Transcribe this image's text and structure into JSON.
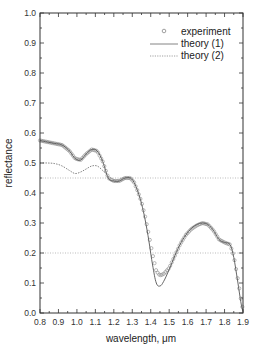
{
  "chart_data": {
    "type": "line",
    "title": "",
    "xlabel": "wavelength, μm",
    "ylabel": "reflectance",
    "xlim": [
      0.8,
      1.9
    ],
    "ylim": [
      0.0,
      1.0
    ],
    "xticks": [
      "0.8",
      "0.9",
      "1.0",
      "1.1",
      "1.2",
      "1.3",
      "1.4",
      "1.5",
      "1.6",
      "1.7",
      "1.8",
      "1.9"
    ],
    "yticks": [
      "0.0",
      "0.1",
      "0.2",
      "0.3",
      "0.4",
      "0.5",
      "0.6",
      "0.7",
      "0.8",
      "0.9",
      "1.0"
    ],
    "grid": false,
    "legend_position": "upper right",
    "reference_lines": [
      0.45,
      0.2
    ],
    "series": [
      {
        "name": "experiment",
        "style": "open-circle markers",
        "x": [
          0.8,
          0.84,
          0.88,
          0.92,
          0.96,
          0.99,
          1.02,
          1.05,
          1.08,
          1.11,
          1.14,
          1.17,
          1.2,
          1.23,
          1.26,
          1.29,
          1.31,
          1.33,
          1.35,
          1.37,
          1.39,
          1.41,
          1.43,
          1.45,
          1.47,
          1.5,
          1.53,
          1.56,
          1.59,
          1.62,
          1.65,
          1.68,
          1.71,
          1.74,
          1.77,
          1.8,
          1.83,
          1.85,
          1.87,
          1.89,
          1.9
        ],
        "values": [
          0.575,
          0.57,
          0.565,
          0.56,
          0.54,
          0.515,
          0.51,
          0.53,
          0.545,
          0.54,
          0.505,
          0.45,
          0.44,
          0.44,
          0.45,
          0.45,
          0.435,
          0.405,
          0.37,
          0.32,
          0.26,
          0.195,
          0.14,
          0.125,
          0.13,
          0.15,
          0.19,
          0.23,
          0.26,
          0.28,
          0.292,
          0.3,
          0.295,
          0.275,
          0.245,
          0.235,
          0.228,
          0.19,
          0.12,
          0.04,
          0.01
        ]
      },
      {
        "name": "theory (1)",
        "style": "solid line",
        "x": [
          0.8,
          0.84,
          0.88,
          0.92,
          0.96,
          0.99,
          1.02,
          1.05,
          1.08,
          1.11,
          1.14,
          1.17,
          1.2,
          1.23,
          1.26,
          1.29,
          1.31,
          1.33,
          1.35,
          1.37,
          1.39,
          1.41,
          1.43,
          1.45,
          1.47,
          1.5,
          1.53,
          1.56,
          1.59,
          1.62,
          1.65,
          1.68,
          1.71,
          1.74,
          1.77,
          1.8,
          1.83,
          1.85,
          1.87,
          1.89,
          1.9
        ],
        "values": [
          0.575,
          0.57,
          0.565,
          0.56,
          0.54,
          0.515,
          0.51,
          0.53,
          0.545,
          0.54,
          0.505,
          0.45,
          0.44,
          0.44,
          0.45,
          0.45,
          0.435,
          0.405,
          0.365,
          0.31,
          0.24,
          0.16,
          0.1,
          0.09,
          0.105,
          0.145,
          0.19,
          0.23,
          0.26,
          0.282,
          0.295,
          0.3,
          0.295,
          0.275,
          0.245,
          0.235,
          0.228,
          0.185,
          0.11,
          0.03,
          0.005
        ]
      },
      {
        "name": "theory (2)",
        "style": "dotted line",
        "x": [
          0.8,
          0.84,
          0.88,
          0.92,
          0.96,
          0.99,
          1.02,
          1.05,
          1.08,
          1.11,
          1.14,
          1.17
        ],
        "values": [
          0.5,
          0.5,
          0.498,
          0.49,
          0.475,
          0.465,
          0.47,
          0.48,
          0.49,
          0.49,
          0.475,
          0.455
        ]
      }
    ]
  },
  "legend": {
    "items": [
      {
        "label": "experiment"
      },
      {
        "label": "theory (1)"
      },
      {
        "label": "theory (2)"
      }
    ]
  },
  "colors": {
    "axis": "#333333",
    "experiment": "#888888",
    "theory1": "#555555",
    "theory2": "#777777",
    "reference": "#aaaaaa"
  }
}
